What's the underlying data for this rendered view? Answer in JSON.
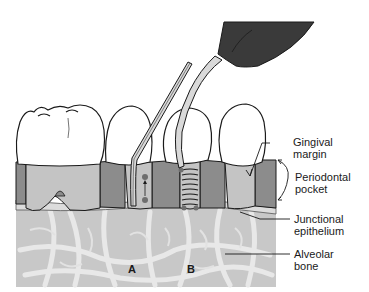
{
  "diagram": {
    "labels": {
      "gingival_margin": [
        "Gingival",
        "margin"
      ],
      "periodontal_pocket": [
        "Periodontal",
        "pocket"
      ],
      "junctional_epithelium": [
        "Junctional",
        "epithelium"
      ],
      "alveolar_bone": [
        "Alveolar",
        "bone"
      ]
    },
    "markers": {
      "a": "A",
      "b": "B"
    },
    "colors": {
      "background": "#ffffff",
      "outline": "#1a1a1a",
      "tooth": "#ffffff",
      "gingiva_dark": "#8c8c8c",
      "root": "#c4c4c4",
      "epithelium": "#dcdcdc",
      "bone": "#c8c8c8",
      "bone_trabeculae": "#e6e6e6",
      "handpiece": "#3a3a3a",
      "probe_shaft": "#d9d9d9",
      "probe_mark": "#6e6e6e"
    }
  }
}
